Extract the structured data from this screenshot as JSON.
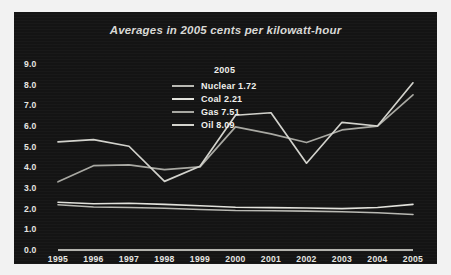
{
  "figure": {
    "background": "#f2f2f2",
    "panel_background": "#141414",
    "text_color": "#e6e6e2"
  },
  "legend": {
    "title": "2005",
    "position": "upper-center",
    "entries": [
      {
        "label": "Nuclear 1.72",
        "name": "Nuclear",
        "value": "1.72",
        "color": "#b9b9b3"
      },
      {
        "label": "Coal 2.21",
        "name": "Coal",
        "value": "2.21",
        "color": "#e2e2dc"
      },
      {
        "label": "Gas 7.51",
        "name": "Gas",
        "value": "7.51",
        "color": "#a8a8a2"
      },
      {
        "label": "Oil 8.09",
        "name": "Oil",
        "value": "8.09",
        "color": "#d2d2cc"
      }
    ]
  },
  "chart_data": {
    "type": "line",
    "title": "Averages in 2005 cents per kilowatt-hour",
    "xlabel": "",
    "ylabel": "",
    "grid": false,
    "legend_position": "upper-center",
    "categories": [
      "1995",
      "1996",
      "1997",
      "1998",
      "1999",
      "2000",
      "2001",
      "2002",
      "2003",
      "2004",
      "2005"
    ],
    "x": [
      1995,
      1996,
      1997,
      1998,
      1999,
      2000,
      2001,
      2002,
      2003,
      2004,
      2005
    ],
    "xlim": [
      1995,
      2005
    ],
    "ylim": [
      0.0,
      9.0
    ],
    "yticks": [
      "9.0",
      "8.0",
      "7.0",
      "6.0",
      "5.0",
      "4.0",
      "3.0",
      "2.0",
      "1.0",
      "0.0"
    ],
    "ytick_values": [
      9.0,
      8.0,
      7.0,
      6.0,
      5.0,
      4.0,
      3.0,
      2.0,
      1.0,
      0.0
    ],
    "series": [
      {
        "name": "Nuclear",
        "color": "#b9b9b3",
        "width": 1.6,
        "values": [
          2.19,
          2.08,
          2.06,
          2.02,
          1.96,
          1.91,
          1.9,
          1.88,
          1.85,
          1.8,
          1.72
        ]
      },
      {
        "name": "Coal",
        "color": "#e2e2dc",
        "width": 1.6,
        "values": [
          2.31,
          2.24,
          2.26,
          2.21,
          2.14,
          2.07,
          2.05,
          2.03,
          2.0,
          2.06,
          2.21
        ]
      },
      {
        "name": "Gas",
        "color": "#a8a8a2",
        "width": 1.7,
        "values": [
          3.3,
          4.08,
          4.12,
          3.89,
          4.02,
          5.96,
          5.62,
          5.2,
          5.81,
          5.99,
          7.51
        ]
      },
      {
        "name": "Oil",
        "color": "#d2d2cc",
        "width": 1.7,
        "values": [
          5.23,
          5.34,
          5.02,
          3.32,
          4.05,
          6.52,
          6.64,
          4.2,
          6.18,
          6.0,
          8.09
        ]
      }
    ]
  }
}
